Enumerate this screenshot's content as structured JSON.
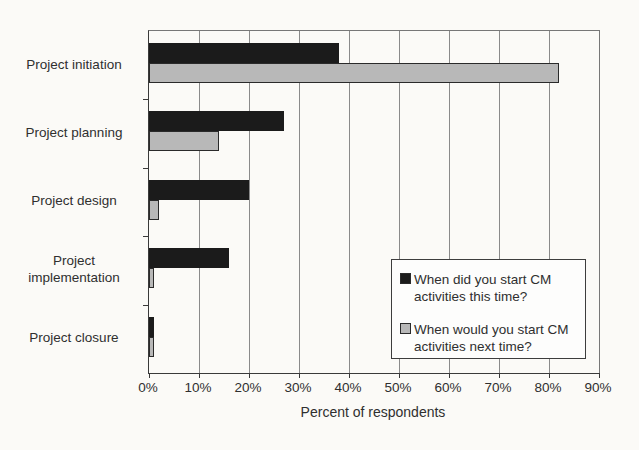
{
  "chart_data": {
    "type": "bar",
    "orientation": "horizontal",
    "title": "",
    "xlabel": "Percent of respondents",
    "xlim": [
      0,
      90
    ],
    "x_tick_step": 10,
    "x_tick_labels": [
      "0%",
      "10%",
      "20%",
      "30%",
      "40%",
      "50%",
      "60%",
      "70%",
      "80%",
      "90%"
    ],
    "grid": "vertical",
    "legend_position": "inside-lower-right",
    "categories": [
      "Project initiation",
      "Project planning",
      "Project design",
      "Project implementation",
      "Project closure"
    ],
    "series": [
      {
        "name": "When did you start CM activities this time?",
        "color": "#1b1b1b",
        "values": [
          38,
          27,
          20,
          16,
          1
        ]
      },
      {
        "name": "When would you start CM activities next time?",
        "color": "#b8b8b8",
        "values": [
          82,
          14,
          2,
          1,
          1
        ]
      }
    ]
  },
  "legend": {
    "items": [
      {
        "swatch_color": "#1b1b1b",
        "label": "When did you start CM activities this time?"
      },
      {
        "swatch_color": "#b8b8b8",
        "label": "When would you start CM activities next time?"
      }
    ]
  },
  "colors": {
    "background": "#fbfaf7",
    "text": "#2f2f2f",
    "gridline": "#8a8a8a",
    "axis": "#3a3a3a",
    "bar_black": "#1b1b1b",
    "bar_gray": "#b8b8b8",
    "bar_border": "#2a2a2a",
    "legend_border": "#3d3d3d",
    "legend_bg": "#fdfdfc"
  }
}
